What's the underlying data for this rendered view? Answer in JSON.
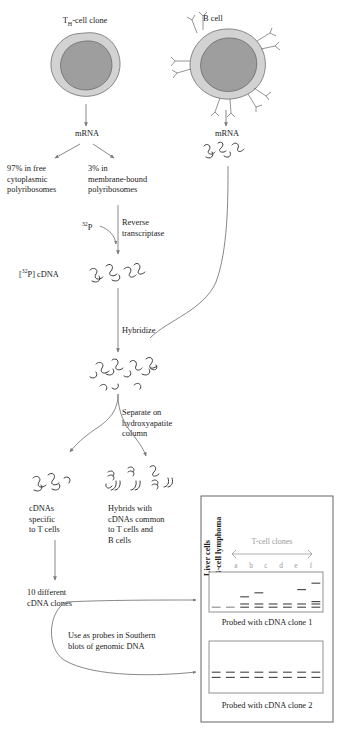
{
  "figure": {
    "cells": [
      {
        "id": "t-cell",
        "label_html": "T<sub>H</sub>-cell clone",
        "label_text": "TH-cell clone"
      },
      {
        "id": "b-cell",
        "label_html": "B cell",
        "label_text": "B cell"
      }
    ],
    "steps": {
      "mrna_left": "mRNA",
      "mrna_right": "mRNA",
      "fraction_free": "97% in free\ncytoplasmic\npolyribosomes",
      "fraction_membrane": "3% in\nmembrane-bound\npolyribosomes",
      "label_32p": "32P",
      "label_32p_html": "<sup>32</sup>P",
      "reverse_transcriptase": "Reverse\ntranscriptase",
      "cdna_product": "[32P] cDNA",
      "cdna_product_html": "[<sup>32</sup>P] cDNA",
      "hybridize": "Hybridize",
      "separate": "Separate on\nhydroxyapatite\ncolumn",
      "cdna_specific": "cDNAs\nspecific\nto T cells",
      "hybrids_common": "Hybrids with\ncDNAs common\nto T cells and\nB cells",
      "ten_clones": "10 different\ncDNA clones",
      "use_as_probes": "Use as probes in Southern\nblots of genomic DNA"
    },
    "gel_panel": {
      "column_labels_rotated": [
        "Liver cells",
        "B-cell lymphoma"
      ],
      "group_label": "T-cell clones",
      "lane_labels": [
        "a",
        "b",
        "c",
        "d",
        "e",
        "f"
      ],
      "blots": [
        {
          "caption": "Probed with cDNA clone 1",
          "lanes": [
            {
              "name": "Liver cells",
              "bands": [
                {
                  "y": 0.88,
                  "faint": true
                }
              ]
            },
            {
              "name": "B-cell lymphoma",
              "bands": [
                {
                  "y": 0.88,
                  "faint": true
                }
              ]
            },
            {
              "name": "a",
              "bands": [
                {
                  "y": 0.88
                },
                {
                  "y": 0.8
                },
                {
                  "y": 0.62
                }
              ]
            },
            {
              "name": "b",
              "bands": [
                {
                  "y": 0.88
                },
                {
                  "y": 0.8
                },
                {
                  "y": 0.52
                }
              ]
            },
            {
              "name": "c",
              "bands": [
                {
                  "y": 0.88
                },
                {
                  "y": 0.8
                }
              ]
            },
            {
              "name": "d",
              "bands": [
                {
                  "y": 0.88
                },
                {
                  "y": 0.8
                }
              ]
            },
            {
              "name": "e",
              "bands": [
                {
                  "y": 0.88
                },
                {
                  "y": 0.8
                },
                {
                  "y": 0.44
                }
              ]
            },
            {
              "name": "f",
              "bands": [
                {
                  "y": 0.88
                },
                {
                  "y": 0.8
                },
                {
                  "y": 0.74
                },
                {
                  "y": 0.28
                }
              ]
            }
          ]
        },
        {
          "caption": "Probed with cDNA clone 2",
          "lanes": [
            {
              "name": "Liver cells",
              "bands": [
                {
                  "y": 0.6
                },
                {
                  "y": 0.7
                }
              ]
            },
            {
              "name": "B-cell lymphoma",
              "bands": [
                {
                  "y": 0.6
                },
                {
                  "y": 0.7
                }
              ]
            },
            {
              "name": "a",
              "bands": [
                {
                  "y": 0.6
                },
                {
                  "y": 0.7
                }
              ]
            },
            {
              "name": "b",
              "bands": [
                {
                  "y": 0.6
                },
                {
                  "y": 0.7
                }
              ]
            },
            {
              "name": "c",
              "bands": [
                {
                  "y": 0.6
                },
                {
                  "y": 0.7
                }
              ]
            },
            {
              "name": "d",
              "bands": [
                {
                  "y": 0.6
                },
                {
                  "y": 0.7
                }
              ]
            },
            {
              "name": "e",
              "bands": [
                {
                  "y": 0.6
                },
                {
                  "y": 0.7
                }
              ]
            },
            {
              "name": "f",
              "bands": [
                {
                  "y": 0.6
                },
                {
                  "y": 0.7
                }
              ]
            }
          ]
        }
      ]
    },
    "colors": {
      "cytoplasm": "#d2d2d2",
      "nucleus": "#9e9e9e",
      "arrow": "#7a7a7a",
      "band": "#4a4a4a",
      "band_faint": "#8d8d8d",
      "text": "#1a1a1a",
      "muted_text": "#9a9a9a"
    }
  }
}
